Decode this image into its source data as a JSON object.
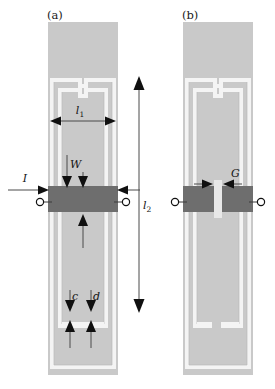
{
  "figure": {
    "type": "technical-diagram",
    "background_color": "#ffffff",
    "substrate_color": "#c8c8c8",
    "trace_gap_color": "#f2f2f2",
    "feed_bar_color": "#6e6e6e",
    "annotation_color": "#101010"
  },
  "panels": [
    {
      "id": "a",
      "label": "(a)",
      "label_x": 47,
      "label_y": 18,
      "x": 48,
      "y": 22,
      "width": 70,
      "height": 353,
      "notch_side": "top",
      "feed_bar": {
        "x": 48,
        "y": 186,
        "width": 70,
        "height": 26,
        "split": false
      },
      "terminals": [
        {
          "name": "left-terminal",
          "cx": 42,
          "cy": 202,
          "r": 3.6
        },
        {
          "name": "right-terminal",
          "cx": 124,
          "cy": 202,
          "r": 3.6
        }
      ],
      "annotations": [
        {
          "name": "l1",
          "label": "l",
          "subscript": "1",
          "kind": "horizontal-double-arrow",
          "x1": 52,
          "x2": 114,
          "y": 121,
          "label_x": 80,
          "label_y": 112
        },
        {
          "name": "W",
          "label": "W",
          "subscript": "",
          "kind": "vertical-down-arrow",
          "x": 67,
          "y1": 155,
          "y2": 186,
          "label_x": 70,
          "label_y": 166
        },
        {
          "name": "I",
          "label": "I",
          "subscript": "",
          "kind": "horizontal-right-arrow",
          "x1": 10,
          "x2": 48,
          "y": 190,
          "label_x": 25,
          "label_y": 180
        },
        {
          "name": "current-return",
          "label": "",
          "subscript": "",
          "kind": "horizontal-left-arrow",
          "x1": 140,
          "x2": 118,
          "y": 190,
          "label_x": 0,
          "label_y": 0
        },
        {
          "name": "inner-up-arrow",
          "label": "",
          "subscript": "",
          "kind": "vertical-up-arrow",
          "x": 83,
          "y1": 248,
          "y2": 214,
          "label_x": 0,
          "label_y": 0
        },
        {
          "name": "c",
          "label": "c",
          "subscript": "",
          "kind": "gap-dimension",
          "x": 70,
          "y_top": 292,
          "y_bot": 326,
          "label_x": 72,
          "label_y": 299
        },
        {
          "name": "d",
          "label": "d",
          "subscript": "",
          "kind": "gap-dimension",
          "x": 90,
          "y_top": 292,
          "y_bot": 326,
          "label_x": 92,
          "label_y": 299
        }
      ]
    },
    {
      "id": "b",
      "label": "(b)",
      "label_x": 182,
      "label_y": 18,
      "x": 183,
      "y": 22,
      "width": 70,
      "height": 353,
      "notch_side": "bottom",
      "feed_bar": {
        "x": 183,
        "y": 186,
        "width": 70,
        "height": 26,
        "split": true
      },
      "terminals": [
        {
          "name": "left-terminal",
          "cx": 177,
          "cy": 202,
          "r": 3.6
        },
        {
          "name": "right-terminal",
          "cx": 259,
          "cy": 202,
          "r": 3.6
        }
      ],
      "annotations": [
        {
          "name": "G",
          "label": "G",
          "subscript": "",
          "kind": "gap-width",
          "x_left": 196,
          "x_right": 236,
          "y": 184,
          "label_x": 231,
          "label_y": 176
        }
      ]
    }
  ],
  "shared_annotations": [
    {
      "name": "l2",
      "label": "l",
      "subscript": "2",
      "kind": "vertical-double-arrow",
      "x": 139,
      "y1": 78,
      "y2": 311,
      "label_x": 143,
      "label_y": 207
    }
  ],
  "dimension_symbols": {
    "l1": "l₁",
    "l2": "l₂",
    "W": "W",
    "I": "I",
    "c": "c",
    "d": "d",
    "G": "G"
  }
}
